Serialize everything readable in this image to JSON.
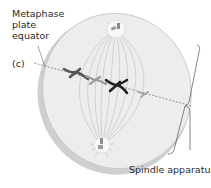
{
  "diagram": {
    "labels": {
      "metaphase_line1": "Metaphase",
      "metaphase_line2": "plate",
      "metaphase_line3": "equator",
      "panel": "(c)",
      "spindle": "Spindle apparatus"
    },
    "elements": {
      "cell": "cell-disk",
      "equator": "metaphase-plate-dashed-line",
      "poles": [
        "upper-spindle-pole",
        "lower-spindle-pole"
      ],
      "chromosomes": [
        {
          "name": "chromosome-1",
          "shade": "dark-gray"
        },
        {
          "name": "chromosome-2",
          "shade": "light-gray"
        },
        {
          "name": "chromosome-3",
          "shade": "black"
        },
        {
          "name": "chromosome-4",
          "shade": "light-gray"
        }
      ],
      "bracket": "spindle-apparatus-bracket"
    },
    "colors": {
      "cell_fill": "#ececec",
      "cell_rim": "#bdbdbd",
      "spindle_fibers": "#c8c8c8",
      "chromosome_dark": "#555555",
      "chromosome_black": "#222222",
      "chromosome_light": "#9a9a9a",
      "equator_line": "#7a7a7a",
      "text": "#2a2a2a"
    }
  }
}
